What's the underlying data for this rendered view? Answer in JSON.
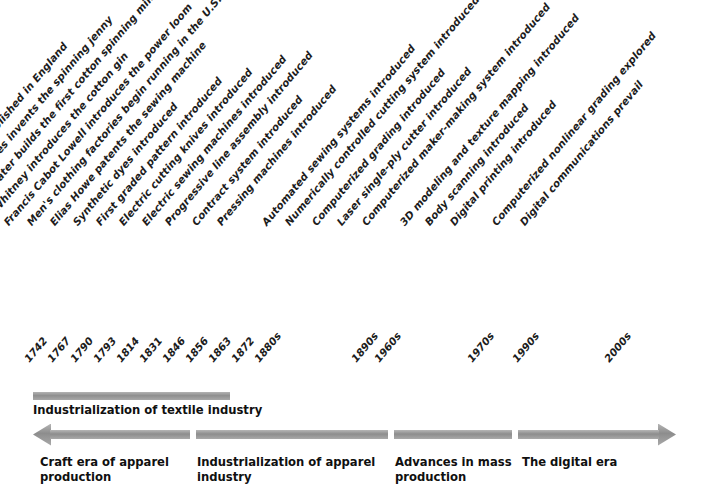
{
  "figure": {
    "name": "apparel-industry-history-timeline",
    "orientation": "horizontal",
    "accent_gray": "#9a9a9a",
    "text_color": "#1a1a1a"
  },
  "events": [
    {
      "year": "1742",
      "label": "Cotton factories established in England",
      "x": 40
    },
    {
      "year": "1767",
      "label": "James Hargreaves invents the spinning jenny",
      "x": 63
    },
    {
      "year": "1790",
      "label": "Samuel Slater builds the first cotton spinning mill in the U.S.",
      "x": 86
    },
    {
      "year": "1793",
      "label": "Eli Whitney introduces the cotton gin",
      "x": 109
    },
    {
      "year": "1814",
      "label": "Francis Cabot Lowell introduces the power loom",
      "x": 132
    },
    {
      "year": "1831",
      "label": "Men's clothing factories begin running in the U.S.",
      "x": 155
    },
    {
      "year": "1846",
      "label": "Elias Howe patents the sewing machine",
      "x": 178
    },
    {
      "year": "1856",
      "label": "Synthetic dyes introduced",
      "x": 201
    },
    {
      "year": "1863",
      "label": "First graded pattern introduced",
      "x": 224
    },
    {
      "year": "1872",
      "label": "Electric cutting knives introduced",
      "x": 247
    },
    {
      "year": "1880s",
      "label": "Electric sewing machines introduced",
      "x": 270
    },
    {
      "year": "",
      "label": "Progressive line assembly introduced",
      "x": 293
    },
    {
      "year": "",
      "label": "Contract system introduced",
      "x": 320
    },
    {
      "year": "1890s",
      "label": "Pressing machines introduced",
      "x": 345
    },
    {
      "year": "1960s",
      "label": "Automated sewing systems introduced",
      "x": 390
    },
    {
      "year": "",
      "label": "Numerically controlled cutting system introduced",
      "x": 413
    },
    {
      "year": "",
      "label": "Computerized grading introduced",
      "x": 440
    },
    {
      "year": "1970s",
      "label": "Laser single-ply cutter introduced",
      "x": 465
    },
    {
      "year": "",
      "label": "Computerized maker-making system introduced",
      "x": 490
    },
    {
      "year": "1990s",
      "label": "3D modeling and texture mapping introduced",
      "x": 528
    },
    {
      "year": "",
      "label": "Body scanning introduced",
      "x": 553
    },
    {
      "year": "",
      "label": "Digital printing introduced",
      "x": 578
    },
    {
      "year": "2000s",
      "label": "Computerized nonlinear grading explored",
      "x": 620
    },
    {
      "year": "",
      "label": "Digital communications prevail",
      "x": 648
    }
  ],
  "year_ticks": [
    {
      "value": "1742",
      "x": 40
    },
    {
      "value": "1767",
      "x": 63
    },
    {
      "value": "1790",
      "x": 86
    },
    {
      "value": "1793",
      "x": 109
    },
    {
      "value": "1814",
      "x": 132
    },
    {
      "value": "1831",
      "x": 155
    },
    {
      "value": "1846",
      "x": 178
    },
    {
      "value": "1856",
      "x": 201
    },
    {
      "value": "1863",
      "x": 224
    },
    {
      "value": "1872",
      "x": 247
    },
    {
      "value": "1880s",
      "x": 270
    },
    {
      "value": "1890s",
      "x": 367
    },
    {
      "value": "1960s",
      "x": 390
    },
    {
      "value": "1970s",
      "x": 483
    },
    {
      "value": "1990s",
      "x": 528
    },
    {
      "value": "2000s",
      "x": 620
    }
  ],
  "textile_band": {
    "caption": "Industrialization of textile industry"
  },
  "eras": [
    {
      "caption_line1": "Craft era of apparel",
      "caption_line2": "production",
      "caption_x": 40,
      "seg_start": 33,
      "seg_end": 190,
      "arrow": "left"
    },
    {
      "caption_line1": "Industrialization of apparel",
      "caption_line2": "industry",
      "caption_x": 197,
      "seg_start": 196,
      "seg_end": 388,
      "arrow": "none"
    },
    {
      "caption_line1": "Advances in mass",
      "caption_line2": "production",
      "caption_x": 395,
      "seg_start": 394,
      "seg_end": 512,
      "arrow": "none"
    },
    {
      "caption_line1": "The digital era",
      "caption_line2": "",
      "caption_x": 522,
      "seg_start": 518,
      "seg_end": 676,
      "arrow": "right"
    }
  ]
}
